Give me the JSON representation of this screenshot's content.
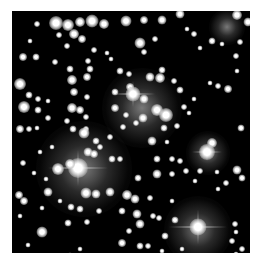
{
  "image": {
    "subject": "star cluster",
    "description": "Grayscale astronomical image of a dense star field with several bright stellar clusters on a black background",
    "colors": {
      "background": "#000000",
      "star": "#ffffff",
      "border": "#ffffff"
    }
  },
  "glows": [
    {
      "x": 72,
      "y": 158,
      "r": 48
    },
    {
      "x": 130,
      "y": 97,
      "r": 40
    },
    {
      "x": 196,
      "y": 142,
      "r": 22
    },
    {
      "x": 186,
      "y": 219,
      "r": 34
    },
    {
      "x": 215,
      "y": 16,
      "r": 18
    }
  ],
  "spikes": [
    {
      "x": 66,
      "y": 157,
      "len": 60
    },
    {
      "x": 121,
      "y": 83,
      "len": 44
    },
    {
      "x": 186,
      "y": 216,
      "len": 58
    },
    {
      "x": 195,
      "y": 141,
      "len": 30
    }
  ],
  "stars": [
    {
      "x": 44,
      "y": 12,
      "s": 14
    },
    {
      "x": 56,
      "y": 14,
      "s": 12
    },
    {
      "x": 68,
      "y": 11,
      "s": 10
    },
    {
      "x": 80,
      "y": 10,
      "s": 13
    },
    {
      "x": 92,
      "y": 13,
      "s": 10
    },
    {
      "x": 114,
      "y": 10,
      "s": 11
    },
    {
      "x": 132,
      "y": 9,
      "s": 8
    },
    {
      "x": 150,
      "y": 9,
      "s": 9
    },
    {
      "x": 168,
      "y": 3,
      "s": 9
    },
    {
      "x": 225,
      "y": 4,
      "s": 10
    },
    {
      "x": 236,
      "y": 11,
      "s": 9
    },
    {
      "x": 25,
      "y": 13,
      "s": 6
    },
    {
      "x": 47,
      "y": 24,
      "s": 6
    },
    {
      "x": 62,
      "y": 23,
      "s": 10
    },
    {
      "x": 70,
      "y": 28,
      "s": 8
    },
    {
      "x": 55,
      "y": 35,
      "s": 6
    },
    {
      "x": 18,
      "y": 30,
      "s": 5
    },
    {
      "x": 128,
      "y": 32,
      "s": 11
    },
    {
      "x": 143,
      "y": 28,
      "s": 6
    },
    {
      "x": 175,
      "y": 18,
      "s": 5
    },
    {
      "x": 182,
      "y": 23,
      "s": 6
    },
    {
      "x": 200,
      "y": 30,
      "s": 7
    },
    {
      "x": 210,
      "y": 33,
      "s": 5
    },
    {
      "x": 228,
      "y": 31,
      "s": 6
    },
    {
      "x": 82,
      "y": 39,
      "s": 6
    },
    {
      "x": 95,
      "y": 42,
      "s": 5
    },
    {
      "x": 132,
      "y": 41,
      "s": 6
    },
    {
      "x": 188,
      "y": 37,
      "s": 5
    },
    {
      "x": 11,
      "y": 46,
      "s": 8
    },
    {
      "x": 24,
      "y": 46,
      "s": 7
    },
    {
      "x": 43,
      "y": 51,
      "s": 6
    },
    {
      "x": 58,
      "y": 58,
      "s": 7
    },
    {
      "x": 76,
      "y": 50,
      "s": 6
    },
    {
      "x": 78,
      "y": 58,
      "s": 7
    },
    {
      "x": 99,
      "y": 48,
      "s": 5
    },
    {
      "x": 150,
      "y": 59,
      "s": 7
    },
    {
      "x": 60,
      "y": 69,
      "s": 10
    },
    {
      "x": 75,
      "y": 66,
      "s": 8
    },
    {
      "x": 108,
      "y": 60,
      "s": 7
    },
    {
      "x": 117,
      "y": 63,
      "s": 6
    },
    {
      "x": 138,
      "y": 66,
      "s": 9
    },
    {
      "x": 148,
      "y": 67,
      "s": 10
    },
    {
      "x": 224,
      "y": 45,
      "s": 6
    },
    {
      "x": 225,
      "y": 60,
      "s": 5
    },
    {
      "x": 8,
      "y": 73,
      "s": 12
    },
    {
      "x": 17,
      "y": 84,
      "s": 7
    },
    {
      "x": 26,
      "y": 88,
      "s": 6
    },
    {
      "x": 36,
      "y": 90,
      "s": 5
    },
    {
      "x": 62,
      "y": 81,
      "s": 8
    },
    {
      "x": 75,
      "y": 86,
      "s": 6
    },
    {
      "x": 103,
      "y": 81,
      "s": 7
    },
    {
      "x": 118,
      "y": 76,
      "s": 8
    },
    {
      "x": 162,
      "y": 70,
      "s": 6
    },
    {
      "x": 168,
      "y": 79,
      "s": 7
    },
    {
      "x": 198,
      "y": 72,
      "s": 5
    },
    {
      "x": 206,
      "y": 75,
      "s": 6
    },
    {
      "x": 216,
      "y": 78,
      "s": 8
    },
    {
      "x": 121,
      "y": 83,
      "s": 15
    },
    {
      "x": 132,
      "y": 88,
      "s": 9
    },
    {
      "x": 145,
      "y": 99,
      "s": 12
    },
    {
      "x": 154,
      "y": 104,
      "s": 14
    },
    {
      "x": 103,
      "y": 97,
      "s": 8
    },
    {
      "x": 114,
      "y": 104,
      "s": 6
    },
    {
      "x": 131,
      "y": 107,
      "s": 9
    },
    {
      "x": 12,
      "y": 96,
      "s": 12
    },
    {
      "x": 26,
      "y": 99,
      "s": 7
    },
    {
      "x": 36,
      "y": 107,
      "s": 6
    },
    {
      "x": 60,
      "y": 97,
      "s": 10
    },
    {
      "x": 68,
      "y": 99,
      "s": 8
    },
    {
      "x": 74,
      "y": 106,
      "s": 6
    },
    {
      "x": 55,
      "y": 110,
      "s": 6
    },
    {
      "x": 8,
      "y": 118,
      "s": 8
    },
    {
      "x": 17,
      "y": 118,
      "s": 6
    },
    {
      "x": 25,
      "y": 117,
      "s": 5
    },
    {
      "x": 61,
      "y": 118,
      "s": 7
    },
    {
      "x": 74,
      "y": 118,
      "s": 6
    },
    {
      "x": 111,
      "y": 116,
      "s": 6
    },
    {
      "x": 124,
      "y": 112,
      "s": 6
    },
    {
      "x": 152,
      "y": 117,
      "s": 7
    },
    {
      "x": 165,
      "y": 115,
      "s": 6
    },
    {
      "x": 229,
      "y": 117,
      "s": 7
    },
    {
      "x": 172,
      "y": 96,
      "s": 6
    },
    {
      "x": 182,
      "y": 88,
      "s": 5
    },
    {
      "x": 177,
      "y": 102,
      "s": 5
    },
    {
      "x": 72,
      "y": 122,
      "s": 11
    },
    {
      "x": 84,
      "y": 130,
      "s": 7
    },
    {
      "x": 98,
      "y": 126,
      "s": 6
    },
    {
      "x": 140,
      "y": 130,
      "s": 9
    },
    {
      "x": 155,
      "y": 131,
      "s": 5
    },
    {
      "x": 200,
      "y": 132,
      "s": 10
    },
    {
      "x": 195,
      "y": 141,
      "s": 16
    },
    {
      "x": 40,
      "y": 136,
      "s": 5
    },
    {
      "x": 28,
      "y": 141,
      "s": 5
    },
    {
      "x": 76,
      "y": 141,
      "s": 9
    },
    {
      "x": 82,
      "y": 143,
      "s": 8
    },
    {
      "x": 88,
      "y": 136,
      "s": 6
    },
    {
      "x": 66,
      "y": 157,
      "s": 20
    },
    {
      "x": 46,
      "y": 158,
      "s": 12
    },
    {
      "x": 58,
      "y": 153,
      "s": 10
    },
    {
      "x": 100,
      "y": 148,
      "s": 7
    },
    {
      "x": 108,
      "y": 148,
      "s": 6
    },
    {
      "x": 145,
      "y": 148,
      "s": 7
    },
    {
      "x": 160,
      "y": 148,
      "s": 6
    },
    {
      "x": 168,
      "y": 150,
      "s": 6
    },
    {
      "x": 11,
      "y": 152,
      "s": 6
    },
    {
      "x": 145,
      "y": 163,
      "s": 9
    },
    {
      "x": 160,
      "y": 163,
      "s": 6
    },
    {
      "x": 174,
      "y": 160,
      "s": 6
    },
    {
      "x": 188,
      "y": 160,
      "s": 6
    },
    {
      "x": 205,
      "y": 161,
      "s": 5
    },
    {
      "x": 225,
      "y": 159,
      "s": 9
    },
    {
      "x": 230,
      "y": 167,
      "s": 7
    },
    {
      "x": 22,
      "y": 162,
      "s": 5
    },
    {
      "x": 34,
      "y": 168,
      "s": 5
    },
    {
      "x": 126,
      "y": 167,
      "s": 7
    },
    {
      "x": 183,
      "y": 170,
      "s": 5
    },
    {
      "x": 214,
      "y": 172,
      "s": 6
    },
    {
      "x": 36,
      "y": 181,
      "s": 9
    },
    {
      "x": 74,
      "y": 182,
      "s": 11
    },
    {
      "x": 84,
      "y": 183,
      "s": 9
    },
    {
      "x": 98,
      "y": 181,
      "s": 9
    },
    {
      "x": 115,
      "y": 184,
      "s": 10
    },
    {
      "x": 123,
      "y": 188,
      "s": 9
    },
    {
      "x": 7,
      "y": 184,
      "s": 8
    },
    {
      "x": 12,
      "y": 190,
      "s": 8
    },
    {
      "x": 48,
      "y": 190,
      "s": 5
    },
    {
      "x": 138,
      "y": 187,
      "s": 6
    },
    {
      "x": 160,
      "y": 190,
      "s": 5
    },
    {
      "x": 206,
      "y": 178,
      "s": 5
    },
    {
      "x": 30,
      "y": 197,
      "s": 5
    },
    {
      "x": 59,
      "y": 196,
      "s": 7
    },
    {
      "x": 68,
      "y": 198,
      "s": 7
    },
    {
      "x": 87,
      "y": 200,
      "s": 6
    },
    {
      "x": 110,
      "y": 200,
      "s": 7
    },
    {
      "x": 125,
      "y": 203,
      "s": 9
    },
    {
      "x": 141,
      "y": 205,
      "s": 6
    },
    {
      "x": 147,
      "y": 207,
      "s": 6
    },
    {
      "x": 8,
      "y": 205,
      "s": 5
    },
    {
      "x": 56,
      "y": 212,
      "s": 7
    },
    {
      "x": 75,
      "y": 211,
      "s": 6
    },
    {
      "x": 128,
      "y": 213,
      "s": 9
    },
    {
      "x": 163,
      "y": 209,
      "s": 7
    },
    {
      "x": 30,
      "y": 221,
      "s": 11
    },
    {
      "x": 117,
      "y": 220,
      "s": 6
    },
    {
      "x": 186,
      "y": 216,
      "s": 17
    },
    {
      "x": 153,
      "y": 225,
      "s": 7
    },
    {
      "x": 223,
      "y": 213,
      "s": 6
    },
    {
      "x": 224,
      "y": 221,
      "s": 5
    },
    {
      "x": 220,
      "y": 230,
      "s": 6
    },
    {
      "x": 16,
      "y": 234,
      "s": 5
    },
    {
      "x": 110,
      "y": 232,
      "s": 8
    },
    {
      "x": 128,
      "y": 235,
      "s": 7
    },
    {
      "x": 136,
      "y": 235,
      "s": 6
    },
    {
      "x": 68,
      "y": 238,
      "s": 5
    },
    {
      "x": 150,
      "y": 240,
      "s": 5
    },
    {
      "x": 20,
      "y": 246,
      "s": 5
    },
    {
      "x": 26,
      "y": 252,
      "s": 4
    },
    {
      "x": 58,
      "y": 244,
      "s": 5
    },
    {
      "x": 170,
      "y": 238,
      "s": 5
    },
    {
      "x": 230,
      "y": 238,
      "s": 6
    },
    {
      "x": 224,
      "y": 243,
      "s": 5
    },
    {
      "x": 96,
      "y": 244,
      "s": 4
    },
    {
      "x": 198,
      "y": 244,
      "s": 4
    },
    {
      "x": 180,
      "y": 248,
      "s": 4
    }
  ]
}
